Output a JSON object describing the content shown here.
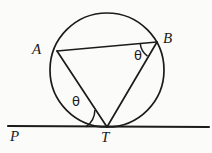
{
  "figure": {
    "kind": "geometry-diagram",
    "background_color": "#fbfbf9",
    "stroke_color": "#1b1b1b",
    "labels": {
      "point_a": "A",
      "point_b": "B",
      "point_t": "T",
      "point_p": "P",
      "angle_at_b": "θ",
      "angle_at_t": "θ"
    },
    "geometry": {
      "circle": {
        "cx": 107,
        "cy": 70,
        "r": 57
      },
      "points": {
        "A": {
          "x": 57,
          "y": 51
        },
        "B": {
          "x": 157,
          "y": 42
        },
        "T": {
          "x": 107,
          "y": 127
        },
        "P_line_start": {
          "x": 8,
          "y": 126
        },
        "P_line_end": {
          "x": 209,
          "y": 127
        }
      },
      "chords": [
        {
          "name": "AB",
          "from": "A",
          "to": "B"
        },
        {
          "name": "AT",
          "from": "A",
          "to": "T"
        },
        {
          "name": "BT",
          "from": "B",
          "to": "T"
        }
      ],
      "tangent_line": {
        "name": "PT",
        "from": "P_line_start",
        "to": "P_line_end"
      },
      "angle_arcs": [
        {
          "name": "arc-at-b",
          "vertex": "B",
          "between": [
            "BA",
            "BT"
          ]
        },
        {
          "name": "arc-at-t",
          "vertex": "T",
          "between": [
            "TP",
            "TA"
          ]
        }
      ]
    }
  }
}
